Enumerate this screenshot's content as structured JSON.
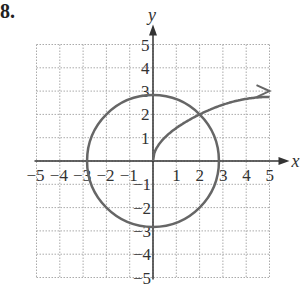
{
  "problem_number": "8.",
  "chart_data": {
    "type": "line",
    "title": "",
    "xlabel": "x",
    "ylabel": "y",
    "xlim": [
      -5,
      5
    ],
    "ylim": [
      -5,
      5
    ],
    "grid": true,
    "x_ticks": [
      "-5",
      "-4",
      "-3",
      "-2",
      "-1",
      "1",
      "2",
      "3",
      "4",
      "5"
    ],
    "y_ticks": [
      "5",
      "4",
      "3",
      "2",
      "1",
      "-1",
      "-2",
      "-3",
      "-4",
      "-5"
    ],
    "series": [
      {
        "name": "circle",
        "shape": "circle",
        "center": [
          0,
          0
        ],
        "radius": 2.83,
        "points": [
          [
            2.83,
            0
          ],
          [
            2,
            2
          ],
          [
            0,
            2.83
          ],
          [
            -2,
            2
          ],
          [
            -2.83,
            0
          ],
          [
            -2,
            -2
          ],
          [
            0,
            -2.83
          ],
          [
            2,
            -2
          ]
        ]
      },
      {
        "name": "curve",
        "shape": "curve-with-arrow",
        "points": [
          [
            0,
            0
          ],
          [
            0.5,
            1
          ],
          [
            1,
            1.41
          ],
          [
            2,
            2
          ],
          [
            3,
            2.45
          ],
          [
            4,
            2.83
          ],
          [
            5,
            3
          ]
        ],
        "arrow_at_end": true
      }
    ],
    "intersections": [
      [
        2,
        2
      ]
    ],
    "colors": {
      "curve": "#666666",
      "axes": "#333333",
      "grid": "#aaaaaa"
    }
  }
}
